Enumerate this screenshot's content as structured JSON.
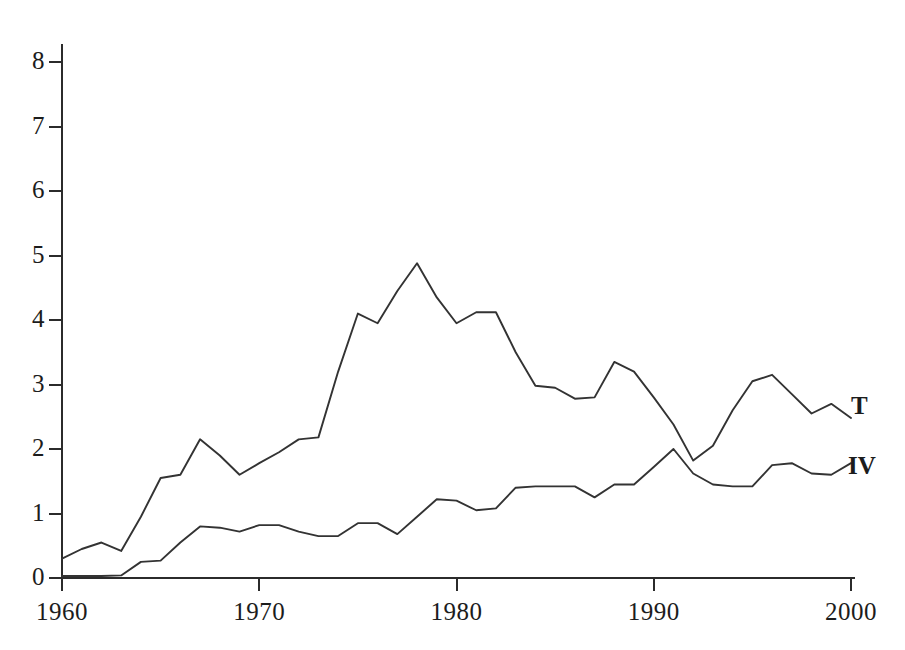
{
  "chart_data": {
    "type": "line",
    "title": "",
    "xlabel": "",
    "ylabel": "",
    "xlim": [
      1960,
      2000
    ],
    "ylim": [
      0,
      8
    ],
    "grid": false,
    "legend_position": "right-inline",
    "x_ticks": [
      "1960",
      "1970",
      "1980",
      "1990",
      "2000"
    ],
    "x_tick_values": [
      1960,
      1970,
      1980,
      1990,
      2000
    ],
    "y_ticks": [
      "0",
      "1",
      "2",
      "3",
      "4",
      "5",
      "6",
      "7",
      "8"
    ],
    "y_tick_values": [
      0,
      1,
      2,
      3,
      4,
      5,
      6,
      7,
      8
    ],
    "x": [
      1960,
      1961,
      1962,
      1963,
      1964,
      1965,
      1966,
      1967,
      1968,
      1969,
      1970,
      1971,
      1972,
      1973,
      1974,
      1975,
      1976,
      1977,
      1978,
      1979,
      1980,
      1981,
      1982,
      1983,
      1984,
      1985,
      1986,
      1987,
      1988,
      1989,
      1990,
      1991,
      1992,
      1993,
      1994,
      1995,
      1996,
      1997,
      1998,
      1999,
      2000
    ],
    "series": [
      {
        "name": "T",
        "label": "T",
        "color": "#333333",
        "values": [
          0.3,
          0.45,
          0.55,
          0.42,
          0.95,
          1.55,
          1.6,
          2.15,
          1.9,
          1.6,
          1.78,
          1.95,
          2.15,
          2.18,
          3.2,
          4.1,
          3.95,
          4.45,
          4.88,
          4.35,
          3.95,
          4.12,
          4.12,
          3.5,
          2.98,
          2.95,
          2.78,
          2.8,
          3.35,
          3.2,
          2.8,
          2.38,
          1.82,
          2.05,
          2.6,
          3.05,
          3.15,
          2.85,
          2.55,
          2.7,
          2.48
        ]
      },
      {
        "name": "IV",
        "label": "IV",
        "color": "#333333",
        "values": [
          0.03,
          0.03,
          0.03,
          0.04,
          0.25,
          0.27,
          0.55,
          0.8,
          0.78,
          0.72,
          0.82,
          0.82,
          0.72,
          0.65,
          0.65,
          0.85,
          0.85,
          0.68,
          0.95,
          1.22,
          1.2,
          1.05,
          1.08,
          1.4,
          1.42,
          1.42,
          1.42,
          1.25,
          1.45,
          1.45,
          1.72,
          2.0,
          1.62,
          1.45,
          1.42,
          1.42,
          1.75,
          1.78,
          1.62,
          1.6,
          1.78
        ]
      }
    ],
    "annotations": [
      {
        "name": "series-label-T",
        "text": "T",
        "series": "T",
        "x_px": 851,
        "y_px": 392
      },
      {
        "name": "series-label-IV",
        "text": "IV",
        "series": "IV",
        "x_px": 848,
        "y_px": 452
      }
    ],
    "style": {
      "line_color": "#333333",
      "axis_color": "#2b2b2b",
      "background": "#ffffff",
      "text_color": "#1c1c1c"
    }
  },
  "geometry": {
    "x_axis_px": {
      "x0": 62,
      "x1": 851
    },
    "y_axis_px": {
      "y0": 578,
      "y1": 62
    },
    "plot_left": 62,
    "plot_right": 851,
    "plot_bottom": 578,
    "plot_top": 62
  }
}
